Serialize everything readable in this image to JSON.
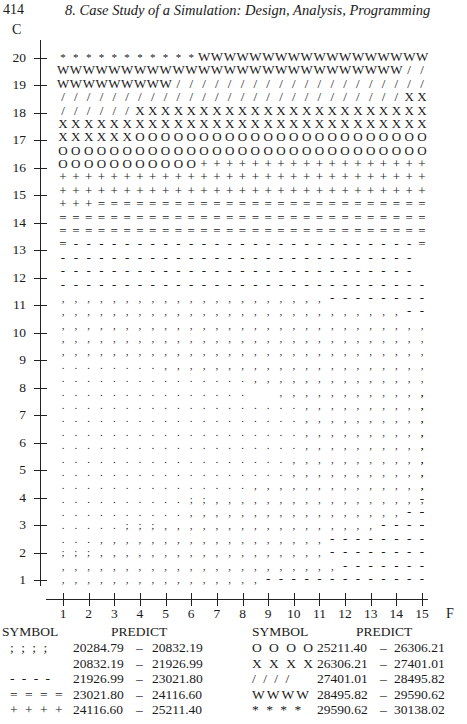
{
  "page": {
    "number": "414",
    "running_head": "8.  Case Study of a Simulation: Design, Analysis, Programming"
  },
  "chart_data": {
    "type": "heatmap",
    "subtype": "character contour plot",
    "title": "",
    "xlabel": "F",
    "ylabel": "C",
    "x_ticks": [
      "1",
      "2",
      "3",
      "4",
      "5",
      "6",
      "7",
      "8",
      "9",
      "10",
      "11",
      "12",
      "13",
      "14",
      "15"
    ],
    "y_ticks": [
      "20",
      "19",
      "18",
      "17",
      "16",
      "15",
      "14",
      "13",
      "12",
      "11",
      "10",
      "9",
      "8",
      "7",
      "6",
      "5",
      "4",
      "3",
      "2",
      "1"
    ],
    "xlim": [
      1,
      15
    ],
    "ylim": [
      1,
      20
    ],
    "grid": false,
    "legend_position": "bottom",
    "response_label": "PREDICT",
    "legend": [
      {
        "symbol": ". . . .",
        "char": ".",
        "range": [
          "",
          ""
        ],
        "note": "lowest band (legend row rendered blank region)"
      },
      {
        "symbol": "; ; ; ;",
        "char": ";",
        "range": [
          "20284.79",
          "20832.19"
        ]
      },
      {
        "symbol": ", , , ,",
        "char": ",",
        "range": [
          "20832.19",
          "21926.99"
        ]
      },
      {
        "symbol": "- - - -",
        "char": "-",
        "range": [
          "21926.99",
          "23021.80"
        ]
      },
      {
        "symbol": "= = = =",
        "char": "=",
        "range": [
          "23021.80",
          "24116.60"
        ]
      },
      {
        "symbol": "+ + + +",
        "char": "+",
        "range": [
          "24116.60",
          "25211.40"
        ]
      },
      {
        "symbol": "O O O O",
        "char": "O",
        "range": [
          "25211.40",
          "26306.21"
        ]
      },
      {
        "symbol": "X X X X",
        "char": "X",
        "range": [
          "26306.21",
          "27401.01"
        ]
      },
      {
        "symbol": "/ / / /",
        "char": "/",
        "range": [
          "27401.01",
          "28495.82"
        ]
      },
      {
        "symbol": "WWWW",
        "char": "W",
        "range": [
          "28495.82",
          "29590.62"
        ]
      },
      {
        "symbol": "* * * *",
        "char": "*",
        "range": [
          "29590.62",
          "30138.02"
        ]
      }
    ],
    "rows": [
      "***********WWWWWWWWWWWWWWWWWW",
      "WWWWWWWWWWWWWWWWWWWWWWWWWWW//",
      "WWWWWWWWW////////////////////",
      "///////////////////////////XX",
      "//////XXXXXXXXXXXXXXXXXXXXXXX",
      "XXXXXXXXXXXXXXXXXXXXXXXXXXXXX",
      "XXXXXXOOOOOOOOOOOOOOOOOOOOOOO",
      "OOOOOOOOOOOOOOOOOOOOOOOOOOOOO",
      "OOOOOOOOOOO++++++++++++++++++",
      "+++++++++++++++++++++++++++++",
      "+++++++++++++++++++++++++++++",
      "+++==========================",
      "=============================",
      "=============================",
      "=--------------------------- =",
      "----------------------------",
      "----------------------------",
      "-----------------------------",
      ",,,,,,,,,,,,,,,,,,,,,--------",
      ",,,,,,,,,,,,,,,,,,,,,,,,,,,--",
      ",,,,,,,,,,,,,,,,,,,,,,,,,,,,,",
      ",,,,,,,,,,,,,,,,,,,,,,,,,,,,,",
      ",,,,,,,,,,,,,,,,,,,,,,,,,,,,,",
      "........,,,,,,,,,,,,,,,,,,,,,",
      "...............,,,,,,,,,,,,,,",
      "...............  ,,,,,,,,,,,,,",
      "...................,,,,,,,,,,,",
      "...................,,,,,,,,,,,",
      "...................,,,,,,,,,,,",
      "...................,,,,,,,,,,,",
      "..................,,,,,,,,,,,,",
      "..................,,,,,,,,,,,,",
      "...............,,,,,,,,,,,,,,,",
      "..........;;,,,,,,,,,,,,,,,,,-",
      "..........,,,,,,,,,,,,,,,,,---",
      ".....;;;,,,,,,,,,,,,,,,,,-----",
      "...,,,,,,,,,,,,,,,,,,--------",
      ";;;,,,,,,,,,,,,,,,,,,--------",
      ",,,,,,,,,,,,,,,,,,,,,,-------",
      ",,,,,,,,,,,,,,,,-------------"
    ]
  },
  "legend_table": {
    "left": {
      "header_symbol": "SYMBOL",
      "header_predict": "PREDICT",
      "items": [
        {
          "symbol": "; ; ; ;",
          "low": "20284.79",
          "high": "20832.19"
        },
        {
          "symbol": "",
          "low": "20832.19",
          "high": "21926.99"
        },
        {
          "symbol": "- - - -",
          "low": "21926.99",
          "high": "23021.80"
        },
        {
          "symbol": "= = = =",
          "low": "23021.80",
          "high": "24116.60"
        },
        {
          "symbol": "+ + + +",
          "low": "24116.60",
          "high": "25211.40"
        }
      ]
    },
    "right": {
      "header_symbol": "SYMBOL",
      "header_predict": "PREDICT",
      "items": [
        {
          "symbol": "O O O O",
          "low": "25211.40",
          "high": "26306.21"
        },
        {
          "symbol": "X X X X",
          "low": "26306.21",
          "high": "27401.01"
        },
        {
          "symbol": "/ / / /",
          "low": "27401.01",
          "high": "28495.82"
        },
        {
          "symbol": "WWWW",
          "low": "28495.82",
          "high": "29590.62"
        },
        {
          "symbol": "* * * *",
          "low": "29590.62",
          "high": "30138.02"
        }
      ]
    },
    "dash": "–"
  }
}
